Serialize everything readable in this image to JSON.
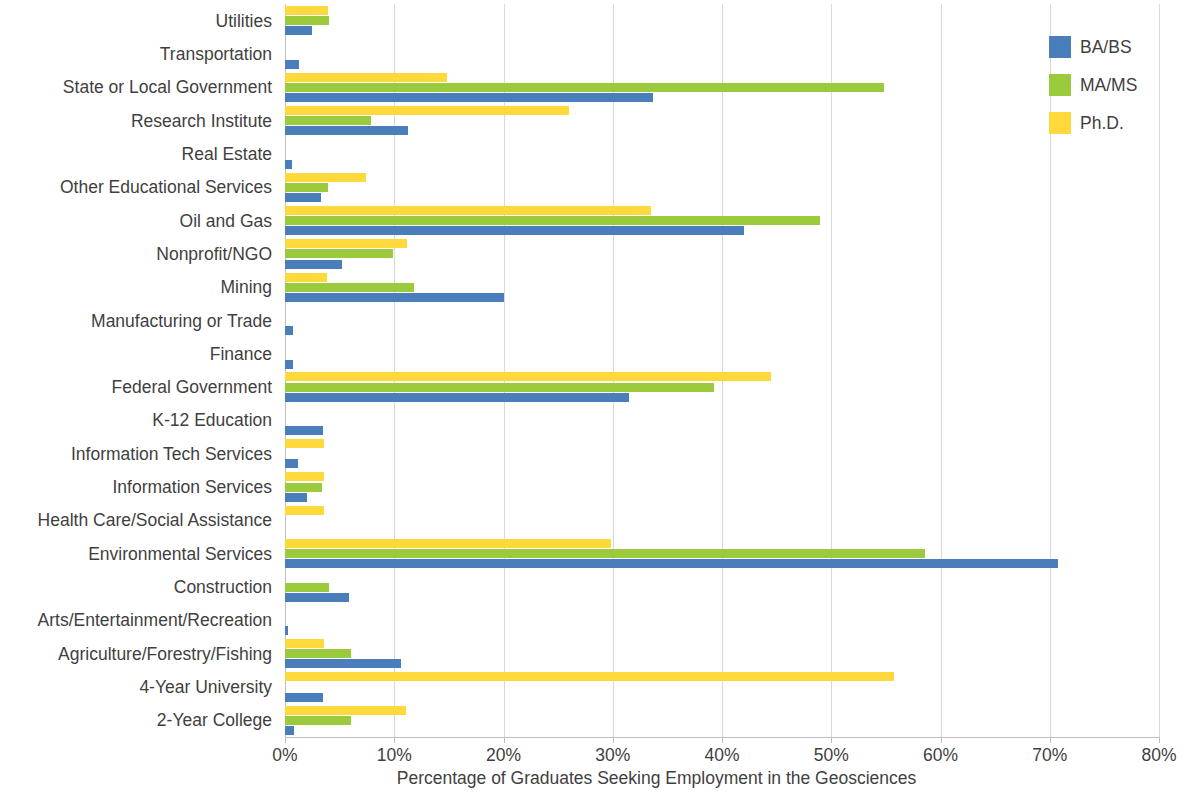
{
  "chart_data": {
    "type": "bar",
    "orientation": "horizontal",
    "title": "",
    "xlabel": "Percentage of Graduates Seeking Employment in the Geosciences",
    "ylabel": "",
    "xlim": [
      0,
      80
    ],
    "xtick_labels": [
      "0%",
      "10%",
      "20%",
      "30%",
      "40%",
      "50%",
      "60%",
      "70%",
      "80%"
    ],
    "xtick_values": [
      0,
      10,
      20,
      30,
      40,
      50,
      60,
      70,
      80
    ],
    "grid": true,
    "legend_position": "top-right",
    "categories": [
      "Utilities",
      "Transportation",
      "State or Local Government",
      "Research Institute",
      "Real Estate",
      "Other Educational Services",
      "Oil and Gas",
      "Nonprofit/NGO",
      "Mining",
      "Manufacturing or Trade",
      "Finance",
      "Federal Government",
      "K-12 Education",
      "Information Tech Services",
      "Information Services",
      "Health Care/Social Assistance",
      "Environmental Services",
      "Construction",
      "Arts/Entertainment/Recreation",
      "Agriculture/Forestry/Fishing",
      "4-Year University",
      "2-Year College"
    ],
    "series": [
      {
        "name": "BA/BS",
        "color": "#4a7ebb",
        "values": [
          2.5,
          1.3,
          33.7,
          11.3,
          0.6,
          3.3,
          42.0,
          5.2,
          20.0,
          0.7,
          0.7,
          31.5,
          3.5,
          1.2,
          2.0,
          0.0,
          70.8,
          5.9,
          0.3,
          10.6,
          3.5,
          0.8
        ]
      },
      {
        "name": "MA/MS",
        "color": "#9bca3c",
        "values": [
          4.0,
          0.0,
          54.8,
          7.9,
          0.0,
          3.9,
          49.0,
          9.9,
          11.8,
          0.0,
          0.0,
          39.3,
          0.0,
          0.0,
          3.4,
          0.0,
          58.6,
          4.0,
          0.0,
          6.0,
          0.0,
          6.0
        ]
      },
      {
        "name": "Ph.D.",
        "color": "#ffd93b",
        "values": [
          3.9,
          0.0,
          14.8,
          26.0,
          0.0,
          7.4,
          33.5,
          11.2,
          3.8,
          0.0,
          0.0,
          44.5,
          0.0,
          3.6,
          3.6,
          3.6,
          29.8,
          0.0,
          0.0,
          3.6,
          55.7,
          11.1
        ]
      }
    ]
  },
  "legend": {
    "entries": [
      {
        "label": "BA/BS",
        "color": "#4a7ebb"
      },
      {
        "label": "MA/MS",
        "color": "#9bca3c"
      },
      {
        "label": "Ph.D.",
        "color": "#ffd93b"
      }
    ]
  }
}
